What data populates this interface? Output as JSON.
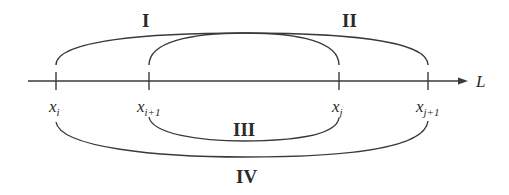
{
  "diagram": {
    "axis": {
      "label": "L",
      "x_start": 28,
      "x_end": 466,
      "y": 81
    },
    "points": [
      {
        "id": "xi",
        "base": "x",
        "sub": "i",
        "x": 56
      },
      {
        "id": "xi1",
        "base": "x",
        "sub": "i+1",
        "x": 149
      },
      {
        "id": "xj",
        "base": "x",
        "sub": "j",
        "x": 339
      },
      {
        "id": "xj1",
        "base": "x",
        "sub": "j+1",
        "x": 428
      }
    ],
    "intervals": [
      {
        "label": "I",
        "from": "x_i",
        "to": "x_j",
        "side": "above"
      },
      {
        "label": "II",
        "from": "x_{i+1}",
        "to": "x_{j+1}",
        "side": "above"
      },
      {
        "label": "III",
        "from": "x_{i+1}",
        "to": "x_j",
        "side": "below"
      },
      {
        "label": "IV",
        "from": "x_i",
        "to": "x_{j+1}",
        "side": "below"
      }
    ],
    "colors": {
      "line": "#3a3a3a",
      "text": "#2a2a2a",
      "background": "#ffffff"
    }
  }
}
